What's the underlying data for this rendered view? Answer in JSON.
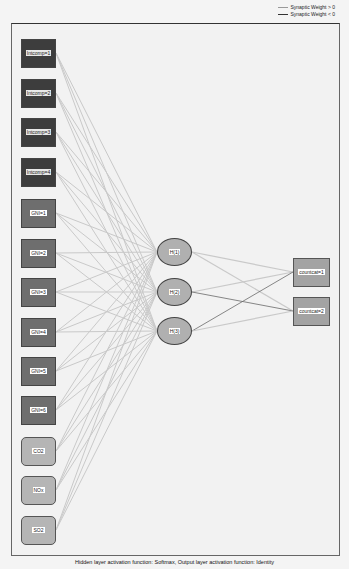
{
  "legend": {
    "positive": "Synaptic Weight > 0",
    "negative": "Synaptic Weight < 0"
  },
  "input_layer": [
    {
      "label": "Intcomp=1",
      "type": "intcomp",
      "cy": 53
    },
    {
      "label": "Intcomp=2",
      "type": "intcomp",
      "cy": 93
    },
    {
      "label": "Intcomp=3",
      "type": "intcomp",
      "cy": 132
    },
    {
      "label": "Intcomp=4",
      "type": "intcomp",
      "cy": 172
    },
    {
      "label": "GNI=1",
      "type": "gni",
      "cy": 213
    },
    {
      "label": "GNI=2",
      "type": "gni",
      "cy": 253
    },
    {
      "label": "GNI=3",
      "type": "gni",
      "cy": 292
    },
    {
      "label": "GNI=4",
      "type": "gni",
      "cy": 332
    },
    {
      "label": "GNI=5",
      "type": "gni",
      "cy": 371
    },
    {
      "label": "GNI=6",
      "type": "gni",
      "cy": 410
    },
    {
      "label": "CO2",
      "type": "cov",
      "cy": 451
    },
    {
      "label": "NOx",
      "type": "cov",
      "cy": 490
    },
    {
      "label": "SO2",
      "type": "cov",
      "cy": 530
    }
  ],
  "hidden_layer": [
    {
      "label": "H(1)",
      "cy": 252
    },
    {
      "label": "H(2)",
      "cy": 292
    },
    {
      "label": "H(3)",
      "cy": 331
    }
  ],
  "output_layer": [
    {
      "label": "countcat=1",
      "cy": 272
    },
    {
      "label": "countcat=2",
      "cy": 311
    }
  ],
  "hidden_to_output_weights": [
    {
      "from": "H(1)",
      "to": "countcat=1",
      "sign": "positive"
    },
    {
      "from": "H(1)",
      "to": "countcat=2",
      "sign": "positive"
    },
    {
      "from": "H(2)",
      "to": "countcat=1",
      "sign": "positive"
    },
    {
      "from": "H(2)",
      "to": "countcat=2",
      "sign": "negative"
    },
    {
      "from": "H(3)",
      "to": "countcat=1",
      "sign": "negative"
    },
    {
      "from": "H(3)",
      "to": "countcat=2",
      "sign": "positive"
    }
  ],
  "colors": {
    "positive_line": "#c9c9c9",
    "negative_line": "#6a6a6a"
  },
  "caption": "Hidden layer activation function: Softmax, Output layer activation function: Identity"
}
